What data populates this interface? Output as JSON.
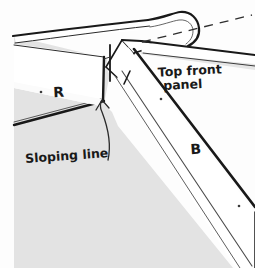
{
  "figure": {
    "kind": "hand-drawn-technical-diagram",
    "background_color": "#fdfdfd",
    "panel_fill_color": "#ffffff",
    "shaded_fill_color": "#e2e2e2",
    "mid_shade_color": "#eaeaea",
    "ink_color": "#191919",
    "thin_ink_color": "#5a5a5a"
  },
  "labels": {
    "rail": "R",
    "batten": "B",
    "top_front_panel_line1": "Top front",
    "top_front_panel_line2": "panel",
    "sloping_line": "Sloping line"
  },
  "annotations": {
    "leader": {
      "name": "sloping-line-leader",
      "from_label": "Sloping line",
      "points_to": "mitre sloping edge"
    },
    "dashed_guide": {
      "name": "dashed-extension-line",
      "style": "dashed",
      "description": "extension of the top front panel edge"
    }
  },
  "marks": {
    "dots": [
      {
        "name": "dot-rail",
        "x": 41,
        "y": 92
      },
      {
        "name": "dot-top-panel",
        "x": 161,
        "y": 99
      },
      {
        "name": "dot-batten",
        "x": 239,
        "y": 206
      }
    ]
  }
}
